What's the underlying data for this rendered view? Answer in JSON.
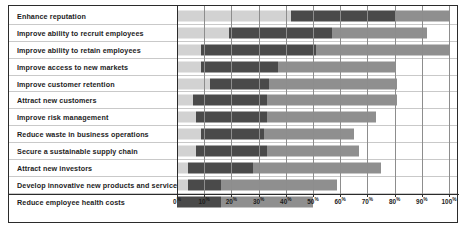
{
  "chart_data": {
    "type": "bar",
    "orientation": "horizontal",
    "stacked": true,
    "title": "",
    "xlabel": "",
    "ylabel": "",
    "xlim": [
      0,
      100
    ],
    "grid": true,
    "legend_position": "none",
    "tick_labels": [
      "0%",
      "10%",
      "20%",
      "30%",
      "40%",
      "50%",
      "60%",
      "70%",
      "80%",
      "90%",
      "100%"
    ],
    "tick_values": [
      0,
      10,
      20,
      30,
      40,
      50,
      60,
      70,
      80,
      90,
      100
    ],
    "series": [
      {
        "name": "segment-1",
        "color": "#d2d2d2"
      },
      {
        "name": "segment-2",
        "color": "#4a4a4a"
      },
      {
        "name": "segment-3",
        "color": "#8f8f8f"
      }
    ],
    "categories": [
      "Enhance reputation",
      "Improve ability to recruit employees",
      "Improve ability to retain employees",
      "Improve access to new markets",
      "Improve customer retention",
      "Attract new customers",
      "Improve risk management",
      "Reduce waste in business operations",
      "Secure a sustainable supply chain",
      "Attract new investors",
      "Develop innovative new products and services",
      "Reduce employee health costs"
    ],
    "rows": [
      {
        "label": "Enhance reputation",
        "values": [
          42,
          38,
          20
        ]
      },
      {
        "label": "Improve ability to recruit employees",
        "values": [
          19,
          38,
          35
        ]
      },
      {
        "label": "Improve ability to retain employees",
        "values": [
          9,
          42,
          49
        ]
      },
      {
        "label": "Improve access to new markets",
        "values": [
          9,
          28,
          43
        ]
      },
      {
        "label": "Improve customer retention",
        "values": [
          12,
          22,
          47
        ]
      },
      {
        "label": "Attract new customers",
        "values": [
          6,
          27,
          48
        ]
      },
      {
        "label": "Improve risk management",
        "values": [
          7,
          26,
          40
        ]
      },
      {
        "label": "Reduce waste in business operations",
        "values": [
          9,
          23,
          33
        ]
      },
      {
        "label": "Secure a sustainable supply chain",
        "values": [
          7,
          26,
          34
        ]
      },
      {
        "label": "Attract new investors",
        "values": [
          4,
          24,
          47
        ]
      },
      {
        "label": "Develop innovative new products and services",
        "values": [
          4,
          12,
          43
        ]
      },
      {
        "label": "Reduce employee health costs",
        "values": [
          0,
          16,
          34
        ]
      }
    ]
  }
}
